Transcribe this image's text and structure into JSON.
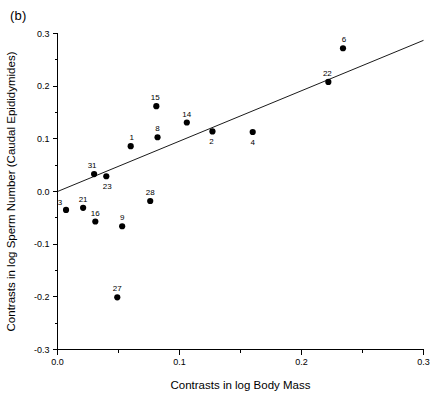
{
  "figure": {
    "panel_label": "(b)",
    "background_color": "#ffffff",
    "ink_color": "#000000"
  },
  "chart_data": {
    "type": "scatter",
    "title": "",
    "xlabel": "Contrasts in log Body Mass",
    "ylabel": "Contrasts in log Sperm Number (Caudal Epididymides)",
    "xlim": [
      0.0,
      0.3
    ],
    "ylim": [
      -0.3,
      0.3
    ],
    "xticks": [
      0.0,
      0.1,
      0.2,
      0.3
    ],
    "xticklabels": [
      "0.0",
      "0.1",
      "0.2",
      "0.3"
    ],
    "xminorticks": [
      0.05,
      0.15,
      0.25
    ],
    "yticks": [
      0.3,
      0.2,
      0.1,
      0.0,
      -0.1,
      -0.2,
      -0.3
    ],
    "yticklabels": [
      "0.3",
      "0.2",
      "0.1",
      "0.0",
      "-0.1",
      "-0.2",
      "-0.3"
    ],
    "yminorticks": [
      0.25,
      0.15,
      0.05,
      -0.05,
      -0.15,
      -0.25
    ],
    "grid": false,
    "legend": false,
    "marker_color": "#000000",
    "marker_size": 3.1,
    "points": [
      {
        "label": "3",
        "x": 0.007,
        "y": -0.035,
        "label_dx": -6,
        "label_dy": -5
      },
      {
        "label": "21",
        "x": 0.021,
        "y": -0.031,
        "label_dx": 0,
        "label_dy": -6
      },
      {
        "label": "31",
        "x": 0.03,
        "y": 0.033,
        "label_dx": -2,
        "label_dy": -6
      },
      {
        "label": "16",
        "x": 0.031,
        "y": -0.057,
        "label_dx": 0,
        "label_dy": -6
      },
      {
        "label": "23",
        "x": 0.04,
        "y": 0.029,
        "label_dx": 1,
        "label_dy": 13
      },
      {
        "label": "27",
        "x": 0.049,
        "y": -0.201,
        "label_dx": 0,
        "label_dy": -6
      },
      {
        "label": "9",
        "x": 0.053,
        "y": -0.066,
        "label_dx": 0,
        "label_dy": -6
      },
      {
        "label": "1",
        "x": 0.06,
        "y": 0.086,
        "label_dx": 1,
        "label_dy": -6
      },
      {
        "label": "28",
        "x": 0.076,
        "y": -0.018,
        "label_dx": 0,
        "label_dy": -6
      },
      {
        "label": "15",
        "x": 0.081,
        "y": 0.162,
        "label_dx": -1,
        "label_dy": -6
      },
      {
        "label": "8",
        "x": 0.082,
        "y": 0.103,
        "label_dx": 0,
        "label_dy": -6
      },
      {
        "label": "14",
        "x": 0.106,
        "y": 0.131,
        "label_dx": 0,
        "label_dy": -6
      },
      {
        "label": "2",
        "x": 0.127,
        "y": 0.114,
        "label_dx": -1,
        "label_dy": 13
      },
      {
        "label": "4",
        "x": 0.16,
        "y": 0.113,
        "label_dx": 0,
        "label_dy": 13
      },
      {
        "label": "22",
        "x": 0.222,
        "y": 0.208,
        "label_dx": -1,
        "label_dy": -6
      },
      {
        "label": "6",
        "x": 0.234,
        "y": 0.272,
        "label_dx": 1,
        "label_dy": -6
      }
    ],
    "fit_line": {
      "name": "regression-line",
      "x0": 0.0,
      "y0": 0.0,
      "x1": 0.3,
      "y1": 0.287
    }
  }
}
